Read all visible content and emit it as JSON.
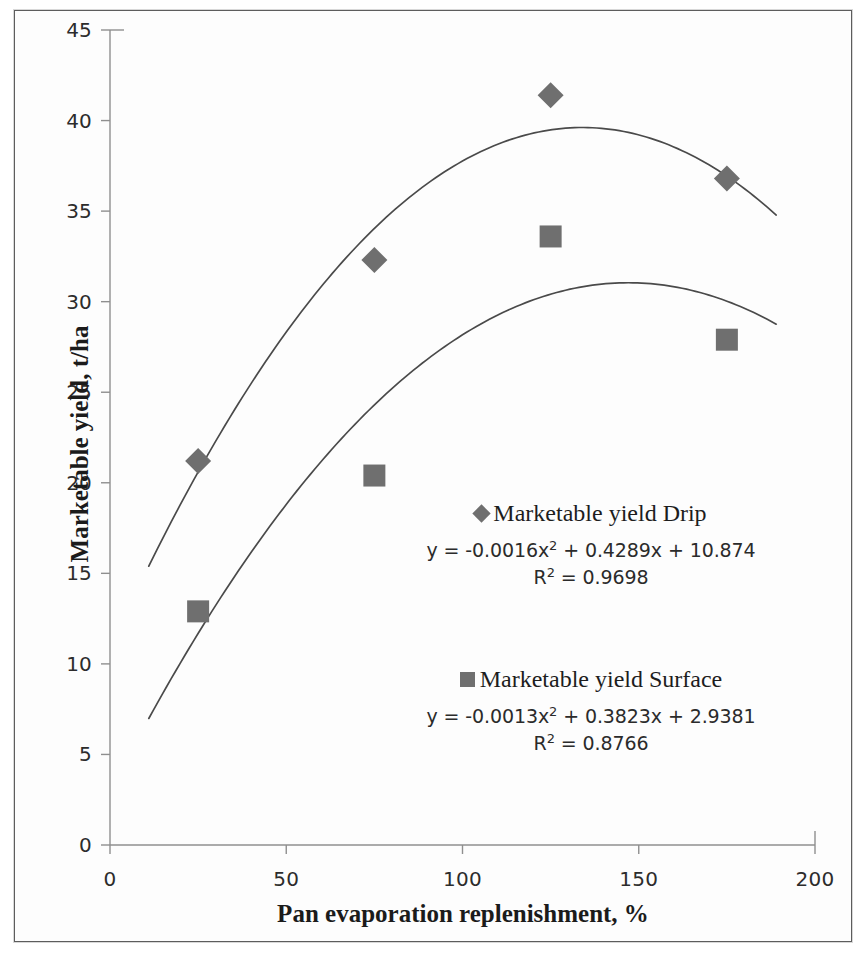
{
  "figure": {
    "kind": "scanned-scatter-plot-figure",
    "background_color": "#fdfdfd",
    "border_color": "#5d5d5d"
  },
  "chart_data": {
    "type": "scatter",
    "title": "",
    "subtitle": "",
    "xlabel": "Pan evaporation replenishment, %",
    "ylabel": "Marketable yield, t/ha",
    "xlim": [
      0,
      200
    ],
    "ylim": [
      0,
      45
    ],
    "xticks": [
      0,
      50,
      100,
      150,
      200
    ],
    "yticks": [
      0,
      5,
      10,
      15,
      20,
      25,
      30,
      35,
      40,
      45
    ],
    "xtick_labels": [
      "0",
      "50",
      "100",
      "150",
      "200"
    ],
    "ytick_labels": [
      "0",
      "5",
      "10",
      "15",
      "20",
      "25",
      "30",
      "35",
      "40",
      "45"
    ],
    "grid": false,
    "legend_position": "inside-right",
    "marker_color": "#6f6f6f",
    "trendline_color": "#4a4a4a",
    "x": [
      25,
      75,
      125,
      175
    ],
    "series": [
      {
        "name": "Marketable yield Drip",
        "marker": "diamond",
        "color": "#6f6f6f",
        "values": [
          21.2,
          32.3,
          41.4,
          36.8
        ],
        "trendline": {
          "type": "polynomial",
          "order": 2,
          "a": -0.0016,
          "b": 0.4289,
          "c": 10.874,
          "equation": "y = -0.0016x² + 0.4289x + 10.874",
          "r_squared": "R² = 0.9698",
          "r_squared_value": 0.9698
        }
      },
      {
        "name": "Marketable yield Surface",
        "marker": "square",
        "color": "#6f6f6f",
        "values": [
          12.9,
          20.4,
          33.6,
          27.9
        ],
        "trendline": {
          "type": "polynomial",
          "order": 2,
          "a": -0.0013,
          "b": 0.3823,
          "c": 2.9381,
          "equation": "y = -0.0013x² + 0.3823x + 2.9381",
          "r_squared": "R² = 0.8766",
          "r_squared_value": 0.8766
        }
      }
    ]
  },
  "legend": {
    "drip": {
      "label": "Marketable yield Drip",
      "equation_prefix": "y = -0.0016x",
      "equation_exp": "2",
      "equation_suffix": " + 0.4289x + 10.874",
      "r2_prefix": "R",
      "r2_exp": "2",
      "r2_suffix": " = 0.9698",
      "marker_icon": "diamond-marker-icon"
    },
    "surface": {
      "label": "Marketable yield Surface",
      "equation_prefix": "y = -0.0013x",
      "equation_exp": "2",
      "equation_suffix": " + 0.3823x + 2.9381",
      "r2_prefix": "R",
      "r2_exp": "2",
      "r2_suffix": " = 0.8766",
      "marker_icon": "square-marker-icon"
    }
  },
  "axes": {
    "x_title": "Pan evaporation replenishment, %",
    "y_title": "Marketable yield, t/ha"
  },
  "geometry": {
    "plot_left": 110,
    "plot_right": 815,
    "plot_top": 30,
    "plot_bottom": 845
  }
}
